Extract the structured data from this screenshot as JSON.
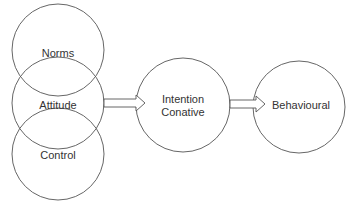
{
  "diagram": {
    "nodes": [
      {
        "id": "norms",
        "label": "Norms",
        "cx": 58,
        "cy": 50,
        "r": 46
      },
      {
        "id": "attitude",
        "label": "Attitude",
        "cx": 58,
        "cy": 103,
        "r": 46
      },
      {
        "id": "control",
        "label": "Control",
        "cx": 58,
        "cy": 154,
        "r": 46
      },
      {
        "id": "intention",
        "label_line1": "Intention",
        "label_line2": "Conative",
        "cx": 183,
        "cy": 105,
        "r": 47
      },
      {
        "id": "behavioural",
        "label": "Behavioural",
        "cx": 299,
        "cy": 107,
        "r": 46
      }
    ],
    "edges": [
      {
        "from": "attitude",
        "to": "intention",
        "style": "block-arrow"
      },
      {
        "from": "intention",
        "to": "behavioural",
        "style": "block-arrow"
      }
    ],
    "colors": {
      "stroke": "#555555",
      "text": "#333333",
      "background": "#ffffff"
    }
  }
}
